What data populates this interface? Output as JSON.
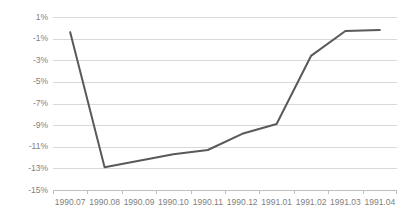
{
  "chart_data": {
    "type": "line",
    "title": "",
    "subtitle": "",
    "xlabel": "",
    "ylabel": "",
    "categories": [
      "1990.07",
      "1990.08",
      "1990.09",
      "1990.10",
      "1990.11",
      "1990.12",
      "1991.01",
      "1991.02",
      "1991.03",
      "1991.04"
    ],
    "series": [
      {
        "name": "",
        "values": [
          -0.4,
          -12.9,
          -12.3,
          -11.7,
          -11.3,
          -9.8,
          -8.9,
          -2.6,
          -0.3,
          -0.2
        ],
        "color": "#595959"
      }
    ],
    "ylim": [
      -15,
      1
    ],
    "ytick_labels": [
      "1%",
      "-1%",
      "-3%",
      "-5%",
      "-7%",
      "-9%",
      "-11%",
      "-13%",
      "-15%"
    ],
    "ytick_values": [
      1,
      -1,
      -3,
      -5,
      -7,
      -9,
      -11,
      -13,
      -15
    ],
    "grid": true,
    "grid_color": "#d9d9d9",
    "legend": "none",
    "legend_position": "none",
    "background": "#ffffff",
    "axis_label_color": "#7f7f7f"
  }
}
